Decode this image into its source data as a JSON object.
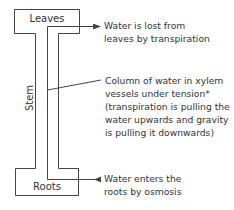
{
  "diagram": {
    "parts": {
      "leaves": "Leaves",
      "stem": "Stem",
      "roots": "Roots"
    },
    "callouts": {
      "transpiration": [
        "Water is lost from",
        "leaves by transpiration"
      ],
      "xylem_column": [
        "Column of water in xylem",
        "vessels under tension*",
        "(transpiration is pulling the",
        "water upwards and gravity",
        "is pulling it downwards)"
      ],
      "osmosis": [
        "Water enters the",
        "roots by osmosis"
      ]
    },
    "colors": {
      "line": "#444444",
      "text": "#333333"
    }
  }
}
